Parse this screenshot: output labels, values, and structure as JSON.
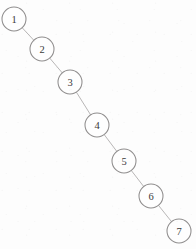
{
  "diagram": {
    "kind": "graph-diagram",
    "canvas": {
      "width": 196,
      "height": 249,
      "background_color": "#fdfdfd"
    },
    "style": {
      "node_stroke_color": "#8f8d8d",
      "node_fill_color": "#fefefe",
      "node_radius": 12,
      "edge_stroke_color": "#b0aeae",
      "label_color": "#3a3a3a"
    },
    "nodes": [
      {
        "id": "node-1",
        "label": "1",
        "cx": 14,
        "cy": 19,
        "r": 12
      },
      {
        "id": "node-2",
        "label": "2",
        "cx": 42,
        "cy": 49,
        "r": 12
      },
      {
        "id": "node-3",
        "label": "3",
        "cx": 70,
        "cy": 82,
        "r": 12
      },
      {
        "id": "node-4",
        "label": "4",
        "cx": 97,
        "cy": 125,
        "r": 12
      },
      {
        "id": "node-5",
        "label": "5",
        "cx": 124,
        "cy": 161,
        "r": 12
      },
      {
        "id": "node-6",
        "label": "6",
        "cx": 151,
        "cy": 196,
        "r": 12
      },
      {
        "id": "node-7",
        "label": "7",
        "cx": 179,
        "cy": 231,
        "r": 12
      }
    ],
    "edges": [
      {
        "id": "edge-1-2",
        "from": "node-1",
        "to": "node-2"
      },
      {
        "id": "edge-2-3",
        "from": "node-2",
        "to": "node-3"
      },
      {
        "id": "edge-3-4",
        "from": "node-3",
        "to": "node-4"
      },
      {
        "id": "edge-4-5",
        "from": "node-4",
        "to": "node-5"
      },
      {
        "id": "edge-5-6",
        "from": "node-5",
        "to": "node-6"
      },
      {
        "id": "edge-6-7",
        "from": "node-6",
        "to": "node-7"
      }
    ]
  }
}
